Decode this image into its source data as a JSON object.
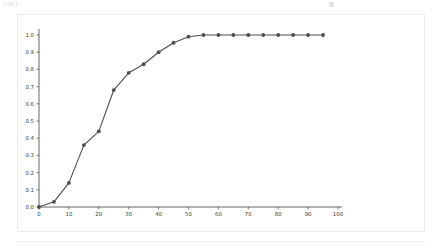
{
  "cell": {
    "prompt_label": "[28]:",
    "right_mark_name": "output-marker"
  },
  "chart_data": {
    "type": "line",
    "title": "",
    "subtitle": "",
    "xlabel": "",
    "ylabel": "",
    "xlim": [
      0,
      100
    ],
    "ylim": [
      0.0,
      1.0
    ],
    "grid": false,
    "legend": null,
    "marker": "circle",
    "line_color": "#4d4d4d",
    "marker_color": "#4d4d4d",
    "x": [
      0,
      5,
      10,
      15,
      20,
      25,
      30,
      35,
      40,
      45,
      50,
      55,
      60,
      65,
      70,
      75,
      80,
      85,
      90,
      95
    ],
    "y": [
      0.0,
      0.03,
      0.14,
      0.36,
      0.44,
      0.68,
      0.78,
      0.83,
      0.9,
      0.955,
      0.99,
      1.0,
      1.0,
      1.0,
      1.0,
      1.0,
      1.0,
      1.0,
      1.0,
      1.0
    ],
    "xticks": [
      0,
      10,
      20,
      30,
      40,
      50,
      60,
      70,
      80,
      90,
      100
    ],
    "xticklabels": [
      "0",
      "10",
      "20",
      "30",
      "40",
      "50",
      "60",
      "70",
      "80",
      "90",
      "100"
    ],
    "yticks": [
      0.0,
      0.1,
      0.2,
      0.3,
      0.4,
      0.5,
      0.6,
      0.7,
      0.8,
      0.9,
      1.0
    ],
    "yticklabels": [
      "0.0",
      "0.1",
      "0.2",
      "0.3",
      "0.4",
      "0.5",
      "0.6",
      "0.7",
      "0.8",
      "0.9",
      "1.0"
    ]
  },
  "colors": {
    "panel_border": "#ececec",
    "axis": "#555555",
    "tick_text": "#3a3a3a",
    "prompt_text": "#d9dadd"
  }
}
